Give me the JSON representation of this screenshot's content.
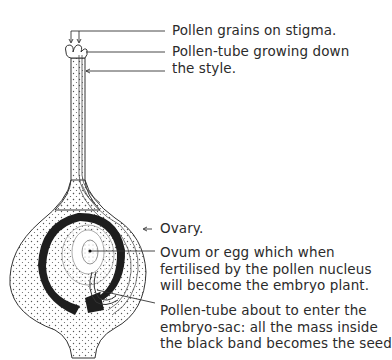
{
  "diagram": {
    "labels": [
      {
        "id": "pollen-grains",
        "lines": [
          "Pollen grains on stigma."
        ]
      },
      {
        "id": "pollen-tube-style",
        "lines": [
          "Pollen-tube growing down",
          "the style."
        ]
      },
      {
        "id": "ovary",
        "lines": [
          "Ovary."
        ]
      },
      {
        "id": "ovum",
        "lines": [
          "Ovum or egg which when",
          "fertilised by the pollen nucleus",
          "will become the embryo plant."
        ]
      },
      {
        "id": "pollen-tube-embryo-sac",
        "lines": [
          "Pollen-tube about to enter the",
          "embryo-sac: all the mass inside",
          "the black band becomes the seed"
        ]
      }
    ],
    "colors": {
      "ink": "#2b2b2b",
      "background": "#ffffff",
      "band": "#1e1e1e"
    }
  }
}
